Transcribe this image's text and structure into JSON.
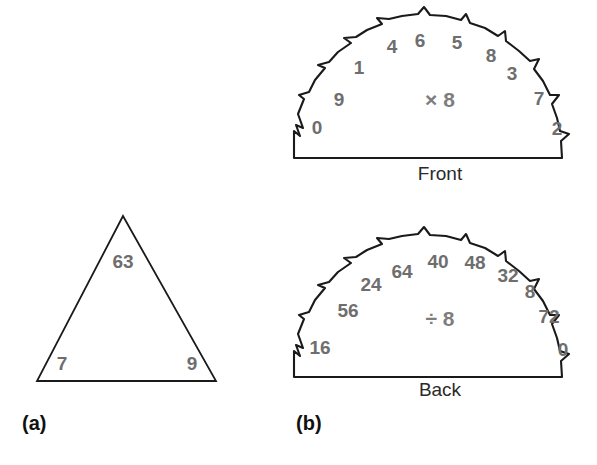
{
  "figure": {
    "panels": [
      {
        "id": "a",
        "label": "(a)"
      },
      {
        "id": "b",
        "label": "(b)"
      }
    ],
    "stroke_color": "#1a1a1a",
    "number_color": "#6e6e6e",
    "caption_color": "#2a2a2a",
    "background_color": "#ffffff"
  },
  "triangle": {
    "top": "63",
    "bottom_left": "7",
    "bottom_right": "9"
  },
  "front_dial": {
    "caption": "Front",
    "operation": "× 8",
    "numbers": [
      {
        "value": "0",
        "x": 317,
        "y": 128
      },
      {
        "value": "9",
        "x": 339,
        "y": 100
      },
      {
        "value": "1",
        "x": 359,
        "y": 68
      },
      {
        "value": "4",
        "x": 392,
        "y": 47
      },
      {
        "value": "6",
        "x": 420,
        "y": 41
      },
      {
        "value": "5",
        "x": 457,
        "y": 43
      },
      {
        "value": "8",
        "x": 491,
        "y": 56
      },
      {
        "value": "3",
        "x": 512,
        "y": 74
      },
      {
        "value": "7",
        "x": 539,
        "y": 99
      },
      {
        "value": "2",
        "x": 557,
        "y": 129
      }
    ]
  },
  "back_dial": {
    "caption": "Back",
    "operation": "÷ 8",
    "numbers": [
      {
        "value": "16",
        "x": 320,
        "y": 348
      },
      {
        "value": "56",
        "x": 348,
        "y": 311
      },
      {
        "value": "24",
        "x": 371,
        "y": 285
      },
      {
        "value": "64",
        "x": 402,
        "y": 272
      },
      {
        "value": "40",
        "x": 438,
        "y": 262
      },
      {
        "value": "48",
        "x": 475,
        "y": 263
      },
      {
        "value": "32",
        "x": 508,
        "y": 276
      },
      {
        "value": "8",
        "x": 530,
        "y": 292
      },
      {
        "value": "72",
        "x": 549,
        "y": 317
      },
      {
        "value": "0",
        "x": 563,
        "y": 350
      }
    ]
  }
}
